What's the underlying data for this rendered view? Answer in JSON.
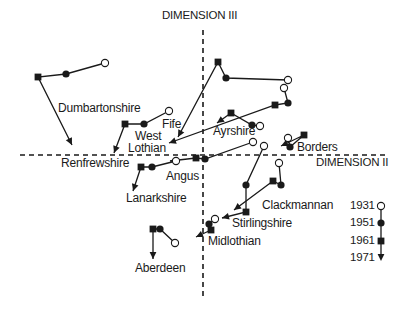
{
  "figure": {
    "axes": {
      "vertical": {
        "label": "DIMENSION III",
        "x": 203,
        "y1": 30,
        "y2": 296,
        "label_x": 162,
        "label_y": 10
      },
      "horizontal": {
        "label": "DIMENSION II",
        "y": 155,
        "x1": 20,
        "x2": 385,
        "label_x": 316,
        "label_y": 157
      }
    },
    "legend": {
      "x": 381,
      "items": [
        {
          "year": "1931",
          "marker": "open-circle",
          "y": 206
        },
        {
          "year": "1951",
          "marker": "filled-circle",
          "y": 223
        },
        {
          "year": "1961",
          "marker": "filled-square",
          "y": 241
        },
        {
          "year": "1971",
          "marker": "arrowhead",
          "y": 258
        }
      ]
    },
    "trajectories": [
      {
        "name": "Dumbartonshire",
        "points": [
          [
            105,
            63
          ],
          [
            66,
            74
          ],
          [
            38,
            77
          ],
          [
            72,
            145
          ]
        ]
      },
      {
        "name": "Fife",
        "points": [
          [
            169,
            111
          ],
          [
            144,
            124
          ],
          [
            125,
            124
          ],
          [
            114,
            153
          ]
        ]
      },
      {
        "name": "Fife-long",
        "points": [
          [
            288,
            80
          ],
          [
            226,
            78
          ],
          [
            218,
            62
          ],
          [
            178,
            137
          ]
        ]
      },
      {
        "name": "West Lothian",
        "points": [
          [
            284,
            88
          ],
          [
            288,
            103
          ],
          [
            275,
            105
          ],
          [
            169,
            143
          ]
        ]
      },
      {
        "name": "Ayrshire",
        "points": [
          [
            260,
            126
          ],
          [
            252,
            125
          ],
          [
            231,
            113
          ],
          [
            217,
            123
          ]
        ]
      },
      {
        "name": "Borders",
        "points": [
          [
            288,
            138
          ],
          [
            290,
            147
          ],
          [
            304,
            135
          ],
          [
            281,
            146
          ]
        ]
      },
      {
        "name": "Angus",
        "points": [
          [
            253,
            142
          ],
          [
            205,
            159
          ],
          [
            196,
            158
          ],
          [
            170,
            161
          ]
        ]
      },
      {
        "name": "Lanarkshire",
        "points": [
          [
            176,
            161
          ],
          [
            152,
            167
          ],
          [
            141,
            167
          ],
          [
            133,
            191
          ]
        ]
      },
      {
        "name": "Stirlingshire",
        "points": [
          [
            264,
            146
          ],
          [
            246,
            185
          ],
          [
            246,
            212
          ],
          [
            222,
            218
          ]
        ]
      },
      {
        "name": "Clackmannan",
        "points": [
          [
            279,
            163
          ],
          [
            281,
            185
          ],
          [
            273,
            181
          ],
          [
            234,
            210
          ]
        ]
      },
      {
        "name": "Midlothian",
        "points": [
          [
            215,
            219
          ],
          [
            209,
            224
          ],
          [
            211,
            230
          ],
          [
            196,
            237
          ]
        ]
      },
      {
        "name": "Aberdeen",
        "points": [
          [
            175,
            243
          ],
          [
            160,
            229
          ],
          [
            153,
            229
          ],
          [
            153,
            259
          ]
        ]
      }
    ],
    "labels": [
      {
        "text": "Dumbartonshire",
        "x": 58,
        "y": 102
      },
      {
        "text": "Fife",
        "x": 162,
        "y": 118
      },
      {
        "text": "West",
        "x": 135,
        "y": 130
      },
      {
        "text": "Lothian",
        "x": 128,
        "y": 142
      },
      {
        "text": "Ayrshire",
        "x": 213,
        "y": 125
      },
      {
        "text": "Borders",
        "x": 297,
        "y": 141
      },
      {
        "text": "Renfrewshire",
        "x": 61,
        "y": 157
      },
      {
        "text": "Angus",
        "x": 166,
        "y": 170
      },
      {
        "text": "Lanarkshire",
        "x": 126,
        "y": 192
      },
      {
        "text": "Clackmannan",
        "x": 262,
        "y": 199
      },
      {
        "text": "Stirlingshire",
        "x": 232,
        "y": 217
      },
      {
        "text": "Midlothian",
        "x": 208,
        "y": 235
      },
      {
        "text": "Aberdeen",
        "x": 135,
        "y": 262
      }
    ]
  }
}
